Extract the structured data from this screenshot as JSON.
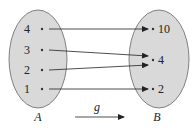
{
  "diagram": {
    "set_a": {
      "label": "A",
      "elements": [
        "4",
        "3",
        "2",
        "1"
      ]
    },
    "set_b": {
      "label": "B",
      "elements": [
        "10",
        "4",
        "2"
      ]
    },
    "function_label": "g",
    "mappings": [
      {
        "from": "4",
        "to": "10"
      },
      {
        "from": "3",
        "to": "4"
      },
      {
        "from": "2",
        "to": "4"
      },
      {
        "from": "1",
        "to": "2"
      }
    ],
    "colors": {
      "set_fill": "#d9d9d9",
      "set_stroke": "#666666",
      "arrow": "#222222"
    }
  }
}
